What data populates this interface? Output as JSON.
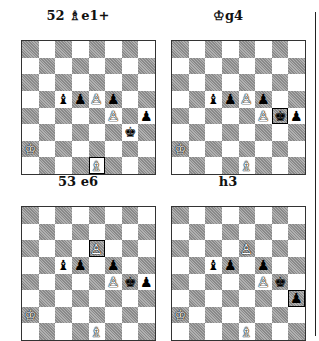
{
  "diagrams": [
    {
      "caption": "52 ♗e1+",
      "pieces": {
        "c5": "bB",
        "d5": "bP",
        "e5": "wP",
        "f5": "bP",
        "f4": "wP",
        "h4": "bP",
        "g3": "bK",
        "a2": "wK",
        "e1": "wB"
      },
      "highlight": "e1"
    },
    {
      "caption": "♔g4",
      "pieces": {
        "c5": "bB",
        "d5": "bP",
        "e5": "wP",
        "f5": "bP",
        "f4": "wP",
        "g4": "bK",
        "h4": "bP",
        "a2": "wK",
        "e1": "wB"
      },
      "highlight": "g4"
    },
    {
      "caption": "53 e6",
      "pieces": {
        "e6": "wP",
        "c5": "bB",
        "d5": "bP",
        "f5": "bP",
        "f4": "wP",
        "g4": "bK",
        "h4": "bP",
        "a2": "wK",
        "e1": "wB"
      },
      "highlight": "e6"
    },
    {
      "caption": "h3",
      "pieces": {
        "e6": "wP",
        "c5": "bB",
        "d5": "bP",
        "f5": "bP",
        "f4": "wP",
        "g4": "bK",
        "h3": "bP",
        "a2": "wK",
        "e1": "wB"
      },
      "highlight": "h3"
    }
  ],
  "glyphs": {
    "wK": "♔",
    "wB": "♗",
    "wP": "♙",
    "bK": "♚",
    "bB": "♝",
    "bP": "♟"
  }
}
